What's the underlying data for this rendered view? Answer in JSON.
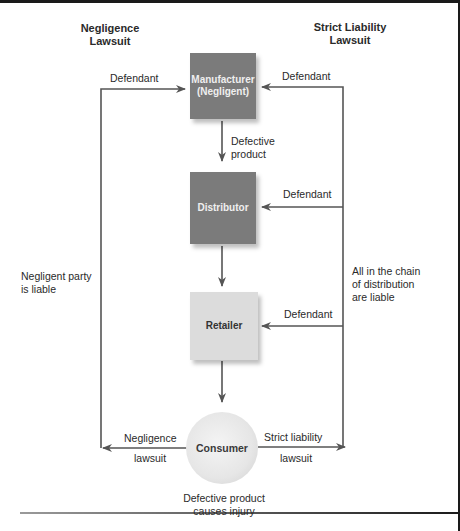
{
  "headings": {
    "left": "Negligence Lawsuit",
    "left_line1": "Negligence",
    "left_line2": "Lawsuit",
    "right": "Strict Liability Lawsuit",
    "right_line1": "Strict Liability",
    "right_line2": "Lawsuit"
  },
  "nodes": {
    "manufacturer": {
      "line1": "Manufacturer",
      "line2": "(Negligent)",
      "fill": "#7b7b7b"
    },
    "distributor": {
      "label": "Distributor",
      "fill": "#7b7b7b"
    },
    "retailer": {
      "label": "Retailer",
      "fill": "#dcdcdc"
    },
    "consumer": {
      "label": "Consumer",
      "fill": "#e6e6e6"
    }
  },
  "edges": {
    "defective_product_line1": "Defective",
    "defective_product_line2": "product",
    "left_defendant": "Defendant",
    "right_defendant_manufacturer": "Defendant",
    "right_defendant_distributor": "Defendant",
    "right_defendant_retailer": "Defendant",
    "negligence_lawsuit_line1": "Negligence",
    "negligence_lawsuit_line2": "lawsuit",
    "strict_liability_lawsuit_line1": "Strict liability",
    "strict_liability_lawsuit_line2": "lawsuit"
  },
  "annotations": {
    "negligent_party_line1": "Negligent party",
    "negligent_party_line2": "is liable",
    "all_in_chain_line1": "All in the chain",
    "all_in_chain_line2": "of distribution",
    "all_in_chain_line3": "are liable",
    "injury_line1": "Defective product",
    "injury_line2": "causes injury"
  },
  "colors": {
    "line": "#555555",
    "dark_box": "#7b7b7b",
    "light_box": "#dcdcdc"
  }
}
